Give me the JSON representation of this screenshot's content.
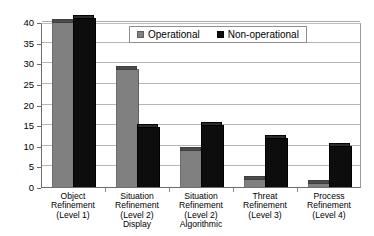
{
  "chart_data": {
    "type": "bar",
    "title": "",
    "subtitle": "",
    "xlabel": "",
    "ylabel": "",
    "ylim": [
      0,
      40
    ],
    "ytick_step": 5,
    "ytick_labels": [
      "40",
      "35",
      "30",
      "25",
      "20",
      "15",
      "10",
      "5",
      "0"
    ],
    "ytick_values": [
      40,
      35,
      30,
      25,
      20,
      15,
      10,
      5,
      0
    ],
    "grid": "horizontal",
    "legend_position": "top-inside",
    "grouped": true,
    "categories": [
      "Object\nRefinement\n(Level 1)",
      "Situation\nRefinement\n(Level 2)\nDisplay",
      "Situation\nRefinement\n(Level 2)\nAlgorithmic",
      "Threat\nRefinement\n(Level 3)",
      "Process\nRefinement\n(Level 4)"
    ],
    "category_lines": [
      [
        "Object",
        "Refinement",
        "(Level 1)"
      ],
      [
        "Situation",
        "Refinement",
        "(Level 2)",
        "Display"
      ],
      [
        "Situation",
        "Refinement",
        "(Level 2)",
        "Algorithmic"
      ],
      [
        "Threat",
        "Refinement",
        "(Level 3)"
      ],
      [
        "Process",
        "Refinement",
        "(Level 4)"
      ]
    ],
    "series": [
      {
        "name": "Operational",
        "color": "#808080",
        "values": [
          40,
          28.5,
          9,
          2,
          1
        ]
      },
      {
        "name": "Non-operational",
        "color": "#0d0d0d",
        "values": [
          41,
          14.5,
          15,
          12,
          10
        ]
      }
    ]
  },
  "legend": {
    "items": [
      {
        "label": "Operational",
        "swatch": "operational-swatch"
      },
      {
        "label": "Non-operational",
        "swatch": "non-operational-swatch"
      }
    ]
  }
}
